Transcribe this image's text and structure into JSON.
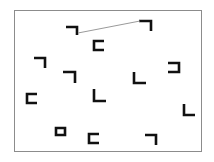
{
  "scene": {
    "title": "visual-search-stimulus",
    "description": "Array of rotated L / corner glyphs inside a thin rectangular frame, with one faint gray line joining two upper glyphs",
    "canvas": {
      "width": 214,
      "height": 162,
      "background": "#ffffff"
    },
    "frame": {
      "x": 14,
      "y": 10,
      "width": 188,
      "height": 142,
      "stroke": "#8c8c8c",
      "fill": "#ffffff",
      "stroke_width": 1
    },
    "glyph_style": {
      "stroke": "#111111",
      "stroke_width": 2.6
    },
    "connector": {
      "name": "connector-line",
      "x1": 78,
      "y1": 33,
      "x2": 140,
      "y2": 21,
      "stroke": "#9a9a9a",
      "stroke_width": 1
    },
    "glyphs": [
      {
        "id": 1,
        "shape": "corner-top-right",
        "label": "¬",
        "x": 66,
        "y": 26,
        "w": 12,
        "h": 9,
        "path": "M 66 27 L 77 27 L 77 35"
      },
      {
        "id": 2,
        "shape": "corner-top-right",
        "label": "¬",
        "x": 139,
        "y": 20,
        "w": 13,
        "h": 10,
        "path": "M 139 21 L 151 21 L 151 31"
      },
      {
        "id": 3,
        "shape": "bracket-left",
        "label": "C",
        "x": 93,
        "y": 40,
        "w": 11,
        "h": 11,
        "path": "M 104 41 L 94 41 L 94 50 L 104 50"
      },
      {
        "id": 4,
        "shape": "corner-top-right",
        "label": "¬",
        "x": 34,
        "y": 57,
        "w": 12,
        "h": 10,
        "path": "M 34 58 L 45 58 L 45 68"
      },
      {
        "id": 5,
        "shape": "bracket-right",
        "label": "Ɔ",
        "x": 168,
        "y": 62,
        "w": 11,
        "h": 11,
        "path": "M 168 63 L 179 63 L 179 72 L 168 72"
      },
      {
        "id": 6,
        "shape": "corner-top-right",
        "label": "¬",
        "x": 63,
        "y": 71,
        "w": 13,
        "h": 11,
        "path": "M 63 72 L 75 72 L 75 83"
      },
      {
        "id": 7,
        "shape": "corner-bottom-left",
        "label": "L",
        "x": 133,
        "y": 72,
        "w": 13,
        "h": 11,
        "path": "M 134 72 L 134 83 L 146 83"
      },
      {
        "id": 8,
        "shape": "bracket-left",
        "label": "C",
        "x": 26,
        "y": 93,
        "w": 12,
        "h": 11,
        "path": "M 37 94 L 27 94 L 27 103 L 37 103"
      },
      {
        "id": 9,
        "shape": "corner-bottom-left",
        "label": "L",
        "x": 93,
        "y": 89,
        "w": 13,
        "h": 12,
        "path": "M 94 89 L 94 101 L 106 101"
      },
      {
        "id": 10,
        "shape": "corner-bottom-left",
        "label": "L",
        "x": 183,
        "y": 104,
        "w": 12,
        "h": 11,
        "path": "M 184 104 L 184 115 L 195 115"
      },
      {
        "id": 11,
        "shape": "closed-box",
        "label": "▭",
        "x": 55,
        "y": 127,
        "w": 10,
        "h": 9,
        "path": "M 56 128 L 65 128 L 65 135 L 56 135 Z"
      },
      {
        "id": 12,
        "shape": "bracket-left",
        "label": "C",
        "x": 88,
        "y": 133,
        "w": 12,
        "h": 11,
        "path": "M 99 134 L 89 134 L 89 143 L 99 143"
      },
      {
        "id": 13,
        "shape": "corner-top-right",
        "label": "¬",
        "x": 145,
        "y": 134,
        "w": 12,
        "h": 11,
        "path": "M 145 135 L 156 135 L 156 145"
      }
    ]
  }
}
